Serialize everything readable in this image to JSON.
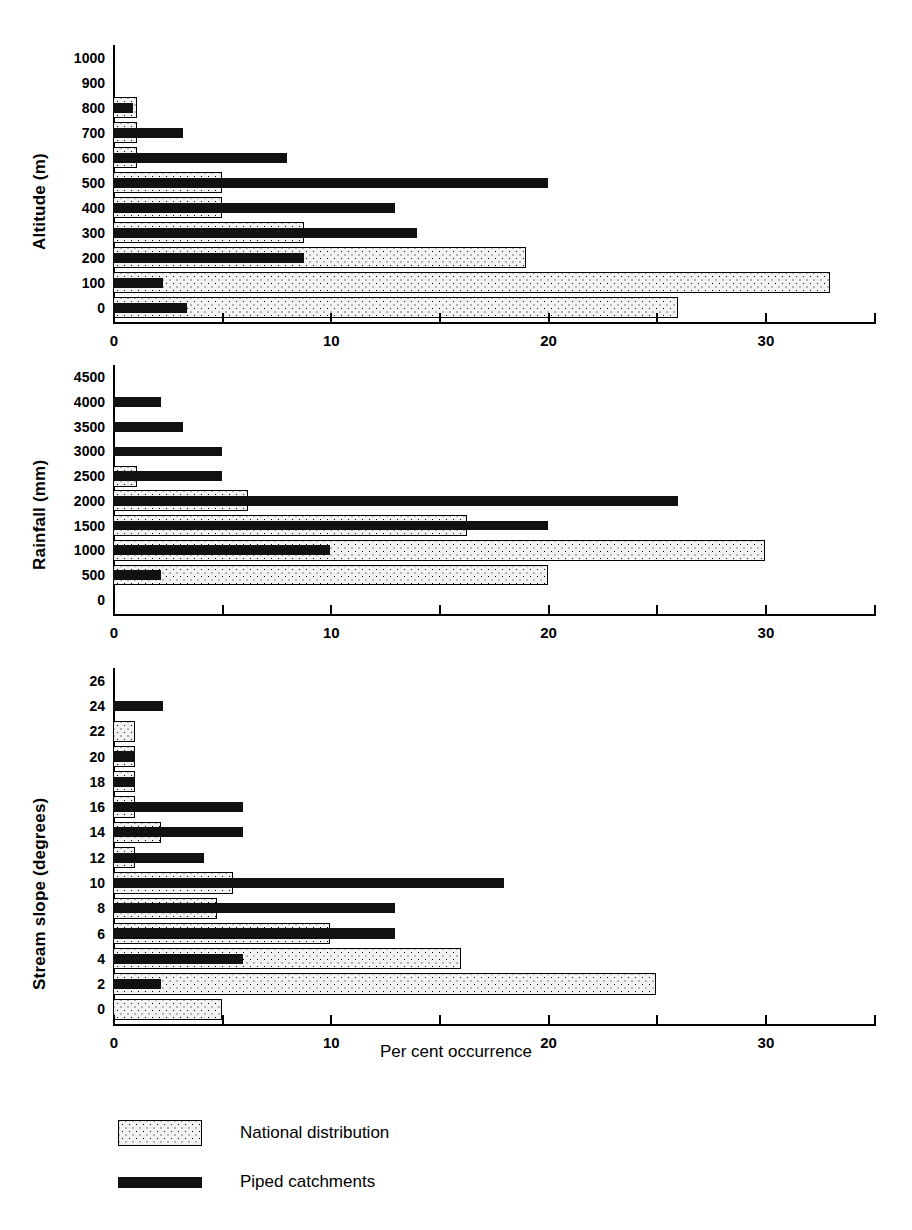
{
  "figure": {
    "xlabel": "Per cent occurrence",
    "x_ticks": [
      "0",
      "10",
      "20",
      "30"
    ],
    "x_tick_values": [
      0,
      10,
      20,
      30
    ],
    "x_minor_values": [
      5,
      15,
      25,
      35
    ],
    "xlim": [
      0,
      35
    ]
  },
  "legend": {
    "position": "bottom-left",
    "items": [
      {
        "key": "national",
        "label": "National distribution",
        "style": "stippled-fill"
      },
      {
        "key": "piped",
        "label": "Piped catchments",
        "style": "solid-black"
      }
    ]
  },
  "chart_data": [
    {
      "type": "bar",
      "orientation": "horizontal",
      "title": "",
      "ylabel": "Altitude (m)",
      "xlabel": "Per cent occurrence",
      "xlim": [
        0,
        35
      ],
      "grid": false,
      "categories": [
        "0",
        "100",
        "200",
        "300",
        "400",
        "500",
        "600",
        "700",
        "800",
        "900",
        "1000"
      ],
      "series": [
        {
          "name": "National distribution",
          "values": [
            26.0,
            33.0,
            19.0,
            8.8,
            5.0,
            5.0,
            1.1,
            1.1,
            1.1,
            0,
            0
          ]
        },
        {
          "name": "Piped catchments",
          "values": [
            3.4,
            2.3,
            8.8,
            14.0,
            13.0,
            20.0,
            8.0,
            3.2,
            0.9,
            0,
            0
          ]
        }
      ]
    },
    {
      "type": "bar",
      "orientation": "horizontal",
      "title": "",
      "ylabel": "Rainfall (mm)",
      "xlabel": "Per cent occurrence",
      "xlim": [
        0,
        35
      ],
      "grid": false,
      "categories": [
        "0",
        "500",
        "1000",
        "1500",
        "2000",
        "2500",
        "3000",
        "3500",
        "4000",
        "4500"
      ],
      "series": [
        {
          "name": "National distribution",
          "values": [
            0,
            20.0,
            30.0,
            16.3,
            6.2,
            1.1,
            0,
            0,
            0,
            0
          ]
        },
        {
          "name": "Piped catchments",
          "values": [
            0,
            2.2,
            10.0,
            20.0,
            26.0,
            5.0,
            5.0,
            3.2,
            2.2,
            0
          ]
        }
      ]
    },
    {
      "type": "bar",
      "orientation": "horizontal",
      "title": "",
      "ylabel": "Stream slope (degrees)",
      "xlabel": "Per cent occurrence",
      "xlim": [
        0,
        35
      ],
      "grid": false,
      "categories": [
        "0",
        "2",
        "4",
        "6",
        "8",
        "10",
        "12",
        "14",
        "16",
        "18",
        "20",
        "22",
        "24",
        "26"
      ],
      "series": [
        {
          "name": "National distribution",
          "values": [
            5.0,
            25.0,
            16.0,
            10.0,
            4.8,
            5.5,
            1.0,
            2.2,
            1.0,
            1.0,
            1.0,
            1.0,
            0,
            0
          ]
        },
        {
          "name": "Piped catchments",
          "values": [
            0,
            2.2,
            6.0,
            13.0,
            13.0,
            18.0,
            4.2,
            6.0,
            6.0,
            1.0,
            1.0,
            0,
            2.3,
            0
          ]
        }
      ]
    }
  ]
}
